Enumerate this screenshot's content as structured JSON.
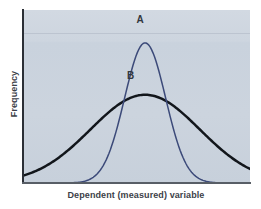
{
  "chart_data": {
    "type": "line",
    "title": "",
    "subtitle": "",
    "xlabel": "Dependent (measured) variable",
    "ylabel": "Frequency",
    "grid": false,
    "legend_position": "inline-annotation",
    "xlim": [
      0,
      100
    ],
    "ylim": [
      0,
      100
    ],
    "axis_ticks": {
      "x": [],
      "y": []
    },
    "annotations": [
      {
        "text": "A",
        "x": 52,
        "y": 90
      },
      {
        "text": "B",
        "x": 50,
        "y": 58
      }
    ],
    "series": [
      {
        "name": "A",
        "label": "A",
        "color": "#3c4a79",
        "line_width": 1.5,
        "description": "narrow normal distribution, small standard deviation, high peak",
        "mean": 54,
        "std_dev": 9,
        "peak_height": 81,
        "x": [
          32,
          36,
          40,
          44,
          48,
          52,
          54,
          56,
          60,
          64,
          68,
          72,
          76
        ],
        "y": [
          0,
          3,
          12,
          33,
          62,
          79,
          81,
          79,
          62,
          33,
          12,
          3,
          0
        ]
      },
      {
        "name": "B",
        "label": "B",
        "color": "#12161b",
        "line_width": 2.5,
        "description": "wide normal distribution, large standard deviation, low flat peak",
        "mean": 54,
        "std_dev": 24,
        "peak_height": 51,
        "x": [
          0,
          8,
          16,
          24,
          32,
          40,
          48,
          54,
          60,
          68,
          76,
          84,
          92,
          100
        ],
        "y": [
          2,
          4,
          8,
          15,
          25,
          37,
          48,
          51,
          48,
          37,
          25,
          15,
          8,
          4
        ]
      }
    ],
    "colors": {
      "panel_background": "#ccd4de",
      "page_background": "#ffffff",
      "axis": "#2b2f36",
      "axis_text": "#3c4148",
      "curve_a": "#3c4a79",
      "curve_b": "#12161b"
    }
  },
  "axes": {
    "x_title": "Dependent (measured) variable",
    "y_title": "Frequency"
  },
  "labels": {
    "curve_a": "A",
    "curve_b": "B"
  }
}
